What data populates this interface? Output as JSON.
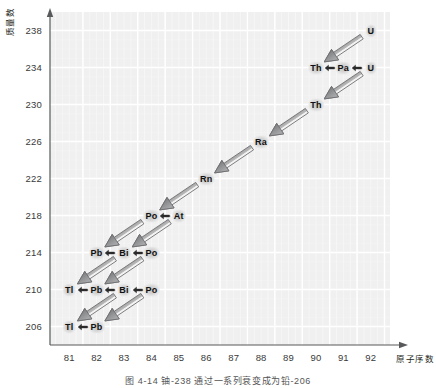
{
  "figure": {
    "caption": "图 4-14  铀-238 通过一系列衰变成为铅-206",
    "background": "#ffffff",
    "plot_background": "#f0f0f0",
    "gridline_color": "#ffffff",
    "axis_color": "#58595b",
    "arrow_fill": "#9a9a9a",
    "arrow_edge": "#6d6e71",
    "chip_glow": "#c8c8c8"
  },
  "axes": {
    "y_title": "质量数",
    "x_title": "原子序数",
    "y_ticks": [
      "238",
      "234",
      "230",
      "226",
      "222",
      "218",
      "214",
      "210",
      "206"
    ],
    "x_ticks": [
      "81",
      "82",
      "83",
      "84",
      "85",
      "86",
      "87",
      "88",
      "89",
      "90",
      "91",
      "92"
    ],
    "y_min": 204,
    "y_max": 240,
    "x_min": 80.3,
    "x_max": 92.7
  },
  "chart_data": {
    "type": "scatter",
    "title": "图 4-14  铀-238 通过一系列衰变成为铅-206",
    "xlabel": "原子序数",
    "ylabel": "质量数",
    "xlim": [
      80.3,
      92.7
    ],
    "ylim": [
      204,
      240
    ],
    "grid": true,
    "legend": null,
    "nuclides": [
      {
        "label": "U",
        "z": 92,
        "a": 238
      },
      {
        "label": "Th",
        "z": 90,
        "a": 234
      },
      {
        "label": "Pa",
        "z": 91,
        "a": 234
      },
      {
        "label": "U",
        "z": 92,
        "a": 234
      },
      {
        "label": "Th",
        "z": 90,
        "a": 230
      },
      {
        "label": "Ra",
        "z": 88,
        "a": 226
      },
      {
        "label": "Rn",
        "z": 86,
        "a": 222
      },
      {
        "label": "Po",
        "z": 84,
        "a": 218
      },
      {
        "label": "At",
        "z": 85,
        "a": 218
      },
      {
        "label": "Pb",
        "z": 82,
        "a": 214
      },
      {
        "label": "Bi",
        "z": 83,
        "a": 214
      },
      {
        "label": "Po",
        "z": 84,
        "a": 214
      },
      {
        "label": "Tl",
        "z": 81,
        "a": 210
      },
      {
        "label": "Pb",
        "z": 82,
        "a": 210
      },
      {
        "label": "Bi",
        "z": 83,
        "a": 210
      },
      {
        "label": "Po",
        "z": 84,
        "a": 210
      },
      {
        "label": "Tl",
        "z": 81,
        "a": 206
      },
      {
        "label": "Pb",
        "z": 82,
        "a": 206
      }
    ],
    "alpha_decays": [
      {
        "from_z": 92,
        "from_a": 238,
        "to_z": 90,
        "to_a": 234
      },
      {
        "from_z": 92,
        "from_a": 234,
        "to_z": 90,
        "to_a": 230
      },
      {
        "from_z": 90,
        "from_a": 230,
        "to_z": 88,
        "to_a": 226
      },
      {
        "from_z": 88,
        "from_a": 226,
        "to_z": 86,
        "to_a": 222
      },
      {
        "from_z": 86,
        "from_a": 222,
        "to_z": 84,
        "to_a": 218
      },
      {
        "from_z": 84,
        "from_a": 218,
        "to_z": 82,
        "to_a": 214
      },
      {
        "from_z": 85,
        "from_a": 218,
        "to_z": 83,
        "to_a": 214
      },
      {
        "from_z": 84,
        "from_a": 214,
        "to_z": 82,
        "to_a": 210
      },
      {
        "from_z": 83,
        "from_a": 214,
        "to_z": 81,
        "to_a": 210
      },
      {
        "from_z": 84,
        "from_a": 210,
        "to_z": 82,
        "to_a": 206
      },
      {
        "from_z": 83,
        "from_a": 210,
        "to_z": 81,
        "to_a": 206
      }
    ],
    "beta_decays": [
      {
        "from_z": 92,
        "from_a": 234,
        "to_z": 91,
        "to_a": 234
      },
      {
        "from_z": 91,
        "from_a": 234,
        "to_z": 90,
        "to_a": 234
      },
      {
        "from_z": 85,
        "from_a": 218,
        "to_z": 84,
        "to_a": 218
      },
      {
        "from_z": 84,
        "from_a": 214,
        "to_z": 83,
        "to_a": 214
      },
      {
        "from_z": 83,
        "from_a": 214,
        "to_z": 82,
        "to_a": 214
      },
      {
        "from_z": 84,
        "from_a": 210,
        "to_z": 83,
        "to_a": 210
      },
      {
        "from_z": 83,
        "from_a": 210,
        "to_z": 82,
        "to_a": 210
      },
      {
        "from_z": 82,
        "from_a": 210,
        "to_z": 81,
        "to_a": 210
      },
      {
        "from_z": 82,
        "from_a": 206,
        "to_z": 81,
        "to_a": 206
      }
    ]
  }
}
